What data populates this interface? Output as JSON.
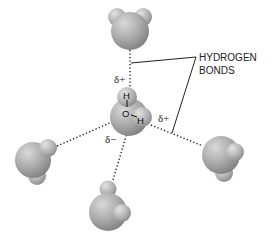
{
  "diagram": {
    "label": {
      "line1": "HYDROGEN",
      "line2": "BONDS"
    },
    "charges": {
      "top": "δ+",
      "right": "δ+",
      "bottom_left": "δ−"
    },
    "central_molecule": {
      "atoms": [
        "H",
        "O",
        "H"
      ]
    },
    "colors": {
      "molecule_fill": "#a8a8a8",
      "molecule_highlight": "#d9d9d9",
      "molecule_shadow": "#7a7a7a",
      "bond_line": "#222222"
    },
    "molecules": [
      {
        "name": "center"
      },
      {
        "name": "top"
      },
      {
        "name": "left"
      },
      {
        "name": "bottom"
      },
      {
        "name": "right"
      }
    ]
  }
}
